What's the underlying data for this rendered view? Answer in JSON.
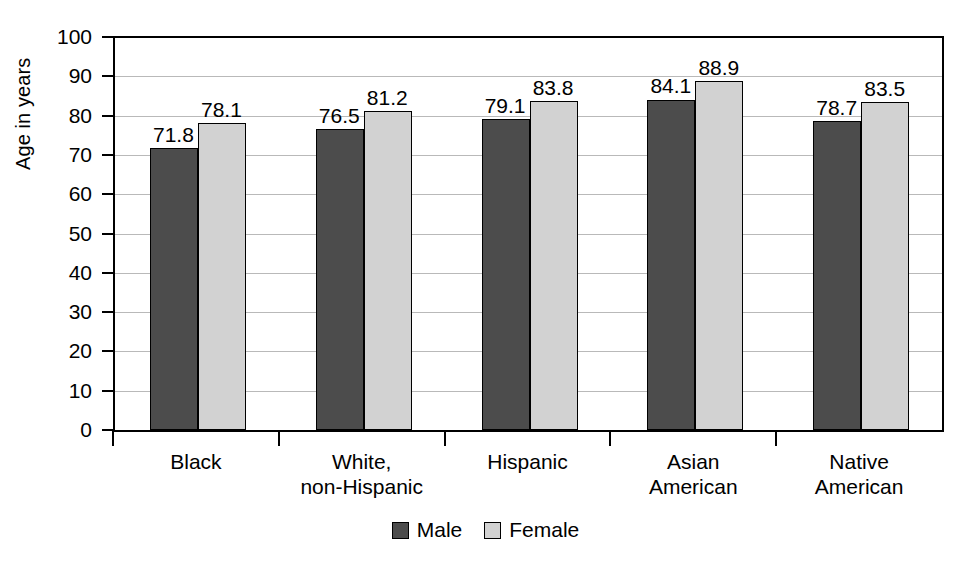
{
  "chart_data": {
    "type": "bar",
    "title": "",
    "subtitle": "",
    "xlabel": "",
    "ylabel": "Age in years",
    "ylim": [
      0,
      100
    ],
    "ytick_step": 10,
    "yticks": [
      "100",
      "90",
      "80",
      "70",
      "60",
      "50",
      "40",
      "30",
      "20",
      "10",
      "0"
    ],
    "grid": true,
    "grid_axis": "y",
    "legend_position": "bottom-center",
    "categories": [
      "Black",
      "White, non-Hispanic",
      "Hispanic",
      "Asian American",
      "Native American"
    ],
    "category_lines": [
      [
        "Black",
        ""
      ],
      [
        "White,",
        "non-Hispanic"
      ],
      [
        "Hispanic",
        ""
      ],
      [
        "Asian",
        "American"
      ],
      [
        "Native",
        "American"
      ]
    ],
    "series": [
      {
        "name": "Male",
        "color": "#4c4c4c",
        "values": [
          71.8,
          76.5,
          79.1,
          84.1,
          78.7
        ],
        "labels": [
          "71.8",
          "76.5",
          "79.1",
          "84.1",
          "78.7"
        ]
      },
      {
        "name": "Female",
        "color": "#d2d2d2",
        "values": [
          78.1,
          81.2,
          83.8,
          88.9,
          83.5
        ],
        "labels": [
          "78.1",
          "81.2",
          "83.8",
          "88.9",
          "83.5"
        ]
      }
    ]
  },
  "legend": {
    "items": [
      {
        "label": "Male",
        "swatch": "male"
      },
      {
        "label": "Female",
        "swatch": "female"
      }
    ]
  },
  "colors": {
    "male_bar": "#4c4c4c",
    "female_bar": "#d2d2d2",
    "axis": "#000000",
    "gridline": "#b9b9b9",
    "background": "#ffffff"
  }
}
